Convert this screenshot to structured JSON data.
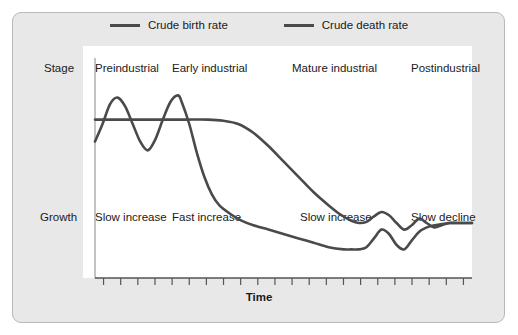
{
  "legend": {
    "items": [
      {
        "label": "Crude birth rate",
        "color": "#4a4a4a",
        "key": "birth"
      },
      {
        "label": "Crude death rate",
        "color": "#4a4a4a",
        "key": "death"
      }
    ]
  },
  "axis": {
    "row_stage_label": "Stage",
    "row_growth_label": "Growth",
    "x_title": "Time"
  },
  "stages": [
    {
      "name": "Preindustrial",
      "growth": "Slow increase"
    },
    {
      "name": "Early industrial",
      "growth": "Fast increase"
    },
    {
      "name": "Mature industrial",
      "growth": "Slow increase"
    },
    {
      "name": "Postindustrial",
      "growth": "Slow decline"
    }
  ],
  "chart_data": {
    "type": "line",
    "title": "",
    "xlabel": "Time",
    "ylabel": "",
    "grid": false,
    "legend_position": "top-center",
    "xlim": [
      0,
      100
    ],
    "ylim": [
      0,
      100
    ],
    "x_tick_count": 22,
    "x_tick_labels": [],
    "y_tick_labels": [],
    "stage_boundaries": [
      0,
      25,
      50,
      75,
      100
    ],
    "series": [
      {
        "name": "Crude birth rate",
        "color": "#4a4a4a",
        "points": [
          [
            0,
            72
          ],
          [
            6,
            72
          ],
          [
            12,
            72
          ],
          [
            18,
            72
          ],
          [
            24,
            72
          ],
          [
            30,
            72
          ],
          [
            34,
            71.5
          ],
          [
            38,
            70
          ],
          [
            42,
            66
          ],
          [
            46,
            60
          ],
          [
            50,
            53
          ],
          [
            54,
            46
          ],
          [
            58,
            39
          ],
          [
            62,
            33
          ],
          [
            65,
            29
          ],
          [
            68,
            26
          ],
          [
            70,
            25
          ],
          [
            72,
            25.5
          ],
          [
            74,
            28
          ],
          [
            76,
            30
          ],
          [
            78,
            28.5
          ],
          [
            80,
            25
          ],
          [
            82,
            22
          ],
          [
            84,
            24
          ],
          [
            86,
            27
          ],
          [
            88,
            25
          ],
          [
            90,
            23
          ],
          [
            92,
            24
          ],
          [
            94,
            25
          ],
          [
            96,
            25
          ],
          [
            100,
            25
          ]
        ]
      },
      {
        "name": "Crude death rate",
        "color": "#4a4a4a",
        "points": [
          [
            0,
            62
          ],
          [
            2,
            70
          ],
          [
            4,
            79
          ],
          [
            6,
            82
          ],
          [
            8,
            78
          ],
          [
            10,
            70
          ],
          [
            12,
            62
          ],
          [
            14,
            58
          ],
          [
            16,
            63
          ],
          [
            18,
            72
          ],
          [
            20,
            80
          ],
          [
            22,
            83
          ],
          [
            23,
            80
          ],
          [
            25,
            70
          ],
          [
            27,
            57
          ],
          [
            29,
            46
          ],
          [
            31,
            38
          ],
          [
            33,
            33
          ],
          [
            36,
            29
          ],
          [
            39,
            26
          ],
          [
            42,
            24
          ],
          [
            46,
            22
          ],
          [
            50,
            20
          ],
          [
            54,
            18
          ],
          [
            58,
            16
          ],
          [
            62,
            14
          ],
          [
            66,
            13
          ],
          [
            68,
            13
          ],
          [
            70,
            13
          ],
          [
            72,
            14
          ],
          [
            74,
            18
          ],
          [
            76,
            22
          ],
          [
            78,
            20
          ],
          [
            80,
            15
          ],
          [
            82,
            13
          ],
          [
            84,
            17
          ],
          [
            86,
            21
          ],
          [
            88,
            23
          ],
          [
            90,
            24
          ],
          [
            92,
            24.5
          ],
          [
            94,
            25
          ],
          [
            96,
            25
          ],
          [
            100,
            25
          ]
        ]
      }
    ]
  }
}
